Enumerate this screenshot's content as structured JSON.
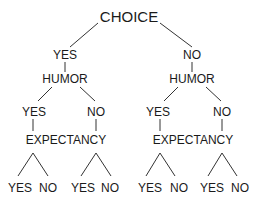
{
  "diagram": {
    "type": "tree",
    "line_color": "#333333",
    "text_color": "#1a1a1a",
    "root": {
      "label": "CHOICE",
      "x": 129,
      "y": 16
    },
    "level1": [
      {
        "label": "YES",
        "x": 65,
        "y": 55
      },
      {
        "label": "NO",
        "x": 192,
        "y": 55
      }
    ],
    "level2": [
      {
        "label": "HUMOR",
        "x": 65,
        "y": 79
      },
      {
        "label": "HUMOR",
        "x": 192,
        "y": 79
      }
    ],
    "level3": [
      {
        "label": "YES",
        "x": 34,
        "y": 112
      },
      {
        "label": "NO",
        "x": 96,
        "y": 112
      },
      {
        "label": "YES",
        "x": 158,
        "y": 112
      },
      {
        "label": "NO",
        "x": 222,
        "y": 112
      }
    ],
    "level4": [
      {
        "label": "EXPECTANCY",
        "x": 66,
        "y": 140
      },
      {
        "label": "EXPECTANCY",
        "x": 193,
        "y": 140
      }
    ],
    "leaves": [
      {
        "label": "YES",
        "x": 20,
        "y": 188
      },
      {
        "label": "NO",
        "x": 48,
        "y": 188
      },
      {
        "label": "YES",
        "x": 83,
        "y": 188
      },
      {
        "label": "NO",
        "x": 110,
        "y": 188
      },
      {
        "label": "YES",
        "x": 150,
        "y": 188
      },
      {
        "label": "NO",
        "x": 179,
        "y": 188
      },
      {
        "label": "YES",
        "x": 212,
        "y": 188
      },
      {
        "label": "NO",
        "x": 240,
        "y": 188
      }
    ],
    "edges": [
      [
        98,
        23,
        70,
        47
      ],
      [
        160,
        23,
        192,
        47
      ],
      [
        65,
        62,
        65,
        72
      ],
      [
        192,
        62,
        192,
        72
      ],
      [
        52,
        87,
        38,
        101
      ],
      [
        80,
        87,
        95,
        101
      ],
      [
        178,
        87,
        164,
        101
      ],
      [
        206,
        87,
        221,
        101
      ],
      [
        33,
        119,
        33,
        131
      ],
      [
        96,
        119,
        96,
        131
      ],
      [
        160,
        119,
        160,
        131
      ],
      [
        222,
        119,
        222,
        131
      ],
      [
        33,
        153,
        18,
        176
      ],
      [
        33,
        153,
        48,
        176
      ],
      [
        96,
        153,
        81,
        176
      ],
      [
        96,
        153,
        111,
        176
      ],
      [
        160,
        153,
        146,
        176
      ],
      [
        160,
        153,
        175,
        176
      ],
      [
        222,
        153,
        208,
        176
      ],
      [
        222,
        153,
        237,
        176
      ]
    ]
  }
}
